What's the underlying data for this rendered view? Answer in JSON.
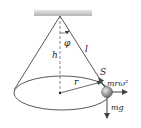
{
  "diagram": {
    "labels": {
      "angle": "φ",
      "length": "l",
      "height": "h",
      "radius": "r",
      "tension": "S",
      "centrifugal": "mrω²",
      "weight": "mg"
    },
    "colors": {
      "line": "#333333",
      "ceiling": "#c8c8c8",
      "ball": "#8a8a8a",
      "text": "#222222"
    }
  }
}
